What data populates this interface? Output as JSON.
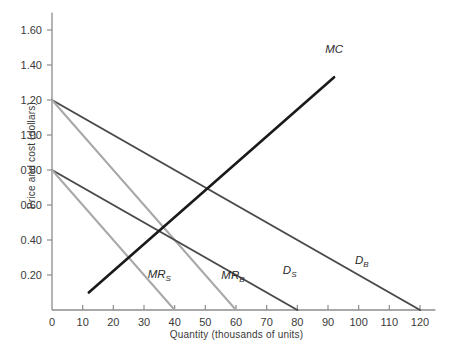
{
  "chart_data": {
    "type": "line",
    "title": "",
    "xlabel": "Quantity (thousands of units)",
    "ylabel": "Price and cost (dollars)",
    "xlim": [
      0,
      125
    ],
    "ylim": [
      0,
      1.7
    ],
    "xticks": [
      0,
      10,
      20,
      30,
      40,
      50,
      60,
      70,
      80,
      90,
      100,
      110,
      120
    ],
    "xticklabels": [
      "0",
      "10",
      "20",
      "30",
      "40",
      "50",
      "60",
      "70",
      "80",
      "90",
      "100",
      "110",
      "120"
    ],
    "yticks": [
      0.2,
      0.4,
      0.6,
      0.8,
      1.0,
      1.2,
      1.4,
      1.6
    ],
    "yticklabels": [
      "0.20",
      "0.40",
      "0.60",
      "0.80",
      "1.00",
      "1.20",
      "1.40",
      "1.60"
    ],
    "grid": false,
    "legend": "inline-annotations",
    "series": [
      {
        "name": "D_B",
        "label": "D",
        "subscript": "B",
        "color": "#4a4a4a",
        "width": 2.0,
        "x": [
          0,
          120
        ],
        "y": [
          1.2,
          0.0
        ],
        "label_x": 101,
        "label_y": 0.265
      },
      {
        "name": "MR_B",
        "label": "MR",
        "subscript": "B",
        "color": "#a8a8a8",
        "width": 2.0,
        "x": [
          0,
          60
        ],
        "y": [
          1.2,
          0.0
        ],
        "label_x": 59,
        "label_y": 0.175
      },
      {
        "name": "D_S",
        "label": "D",
        "subscript": "S",
        "color": "#4a4a4a",
        "width": 2.0,
        "x": [
          0,
          80
        ],
        "y": [
          0.8,
          0.0
        ],
        "label_x": 77.5,
        "label_y": 0.205
      },
      {
        "name": "MR_S",
        "label": "MR",
        "subscript": "S",
        "color": "#a8a8a8",
        "width": 2.0,
        "x": [
          0,
          40
        ],
        "y": [
          0.8,
          0.0
        ],
        "label_x": 35,
        "label_y": 0.185
      },
      {
        "name": "MC",
        "label": "MC",
        "subscript": "",
        "color": "#1a1a1a",
        "width": 2.6,
        "x": [
          12,
          92
        ],
        "y": [
          0.1,
          1.33
        ],
        "label_x": 92,
        "label_y": 1.47
      }
    ]
  },
  "axes": {
    "y_axis_name": "price-and-cost-axis",
    "x_axis_name": "quantity-axis"
  }
}
